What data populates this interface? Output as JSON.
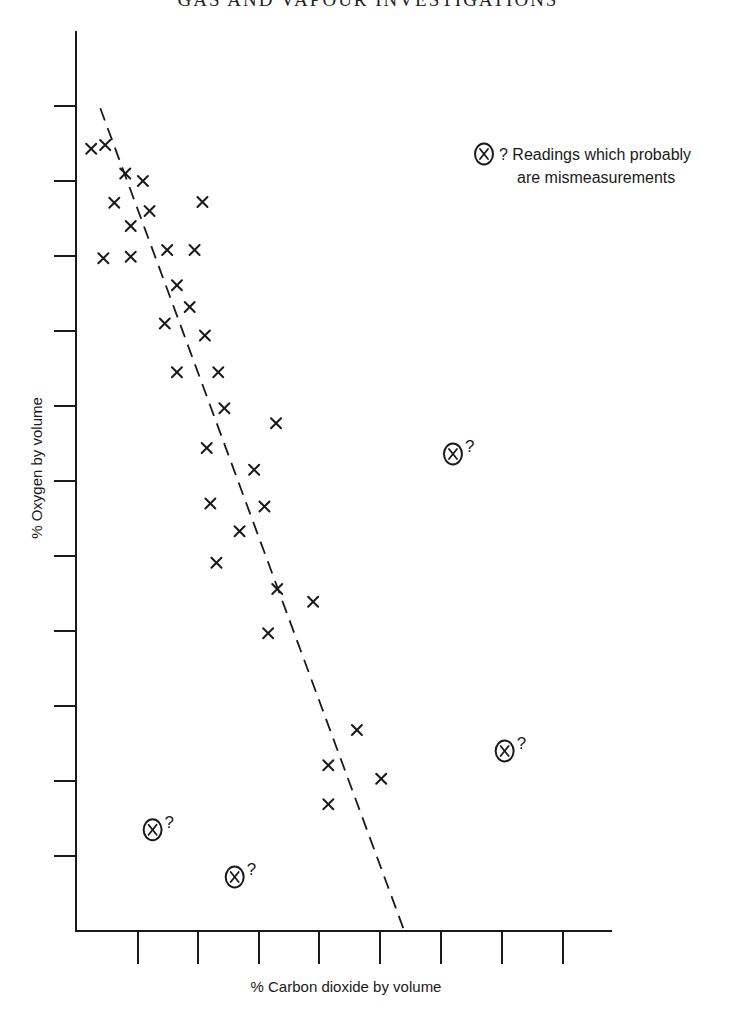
{
  "page": {
    "header": "GAS AND VAPOUR INVESTIGATIONS"
  },
  "chart_data": {
    "type": "scatter",
    "title": "",
    "xlabel": "% Carbon dioxide by volume",
    "ylabel": "% Oxygen by volume",
    "x_tick_labels": [],
    "y_tick_labels": [],
    "grid": false,
    "units_note": "Axes are unlabeled; values expressed in tick units (x ticks 1..8 from origin, y ticks 1..11 from origin).",
    "axis_ranges": {
      "x": [
        0,
        8.8
      ],
      "y": [
        0,
        12
      ]
    },
    "series": [
      {
        "name": "Readings",
        "marker": "x",
        "points": [
          [
            -0.75,
            10.43
          ],
          [
            -0.52,
            10.48
          ],
          [
            -0.19,
            10.1
          ],
          [
            0.1,
            10.0
          ],
          [
            -0.37,
            9.71
          ],
          [
            0.21,
            9.6
          ],
          [
            1.08,
            9.72
          ],
          [
            -0.1,
            9.4
          ],
          [
            0.5,
            9.08
          ],
          [
            0.95,
            9.08
          ],
          [
            -0.55,
            8.97
          ],
          [
            -0.1,
            8.99
          ],
          [
            0.66,
            8.61
          ],
          [
            0.87,
            8.32
          ],
          [
            0.46,
            8.1
          ],
          [
            1.12,
            7.94
          ],
          [
            0.66,
            7.45
          ],
          [
            1.34,
            7.45
          ],
          [
            1.44,
            6.97
          ],
          [
            2.29,
            6.77
          ],
          [
            1.15,
            6.44
          ],
          [
            1.93,
            6.15
          ],
          [
            1.21,
            5.7
          ],
          [
            2.1,
            5.66
          ],
          [
            1.69,
            5.33
          ],
          [
            1.31,
            4.91
          ],
          [
            2.31,
            4.56
          ],
          [
            2.9,
            4.39
          ],
          [
            2.16,
            3.97
          ],
          [
            3.62,
            2.68
          ],
          [
            3.15,
            2.21
          ],
          [
            4.02,
            2.03
          ],
          [
            3.15,
            1.69
          ]
        ]
      },
      {
        "name": "Readings which probably are mismeasurements",
        "marker": "circled-x",
        "points": [
          [
            5.2,
            6.36
          ],
          [
            6.05,
            2.4
          ],
          [
            0.26,
            1.35
          ],
          [
            1.61,
            0.72
          ]
        ]
      }
    ],
    "trendline": {
      "style": "dashed",
      "from": [
        -0.6,
        10.97
      ],
      "to": [
        4.4,
        0.0
      ]
    },
    "legend": {
      "symbol": "circled-x",
      "text_line1": "? Readings which probably",
      "text_line2": "are mismeasurements",
      "position": "top-right"
    },
    "outlier_annotation": "?"
  },
  "layout": {
    "origin_px": [
      76,
      931
    ],
    "x_axis_end_px": 612,
    "y_axis_top_px": 31,
    "x_ticks_px": [
      138,
      198,
      259,
      319,
      380,
      441,
      502,
      563
    ],
    "y_ticks_px": [
      856,
      781,
      706,
      631,
      556,
      481,
      406,
      331,
      256,
      181,
      106
    ],
    "x_unit_px": 60.8,
    "y_unit_px": 75
  }
}
